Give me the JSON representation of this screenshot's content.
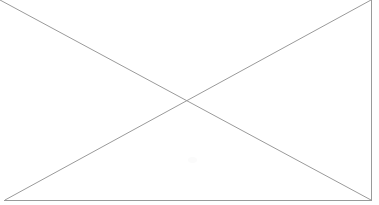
{
  "canvas": {
    "width": 379,
    "height": 205,
    "background_color": "#ffffff"
  },
  "placeholder": {
    "kind": "broken-image-placeholder",
    "description": "Rectangle outline crossed by two diagonals forming an X",
    "has_text": false,
    "has_icon_glyph": false,
    "stroke_color": "#9a9a9a",
    "stroke_width": 1,
    "frame": {
      "left": 5,
      "top": 0,
      "right": 371,
      "bottom": 200,
      "visible_edges": [
        "right",
        "bottom"
      ],
      "clipped_edges": [
        "left",
        "top"
      ]
    },
    "diagonals": [
      {
        "name": "diagonal-tl-br",
        "x1": 0,
        "y1": 0,
        "x2": 371,
        "y2": 200
      },
      {
        "name": "diagonal-bl-tr",
        "x1": 5,
        "y1": 200,
        "x2": 371,
        "y2": 0
      }
    ],
    "crossing_point": {
      "x": 188,
      "y": 99
    },
    "artifact": {
      "name": "scan-smudge",
      "x": 192,
      "y": 160,
      "color": "#fbfbfb"
    }
  }
}
